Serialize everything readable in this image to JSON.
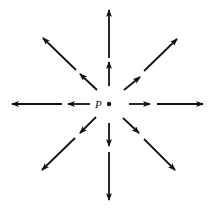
{
  "diagram": {
    "point_label": "P",
    "colors": {
      "stroke": "#111111",
      "background": "#ffffff"
    },
    "center": {
      "x": 109,
      "y": 104
    },
    "arrows": [
      {
        "direction": "up",
        "segments": [
          {
            "from": [
              109,
              86
            ],
            "to": [
              109,
              62
            ]
          },
          {
            "from": [
              109,
              58
            ],
            "to": [
              109,
              10
            ]
          }
        ]
      },
      {
        "direction": "down",
        "segments": [
          {
            "from": [
              109,
              123
            ],
            "to": [
              109,
              146
            ]
          },
          {
            "from": [
              109,
              152
            ],
            "to": [
              109,
              200
            ]
          }
        ]
      },
      {
        "direction": "left",
        "segments": [
          {
            "from": [
              90,
              104
            ],
            "to": [
              68,
              104
            ]
          },
          {
            "from": [
              62,
              104
            ],
            "to": [
              12,
              104
            ]
          }
        ]
      },
      {
        "direction": "right",
        "segments": [
          {
            "from": [
              129,
              104
            ],
            "to": [
              150,
              104
            ]
          },
          {
            "from": [
              157,
              104
            ],
            "to": [
              203,
              104
            ]
          }
        ]
      },
      {
        "direction": "up-left",
        "segments": [
          {
            "from": [
              97,
              90
            ],
            "to": [
              80,
              74
            ]
          },
          {
            "from": [
              76,
              70
            ],
            "to": [
              43,
              38
            ]
          }
        ]
      },
      {
        "direction": "up-right",
        "segments": [
          {
            "from": [
              124,
              90
            ],
            "to": [
              140,
              77
            ]
          },
          {
            "from": [
              144,
              71
            ],
            "to": [
              177,
              39
            ]
          }
        ]
      },
      {
        "direction": "down-left",
        "segments": [
          {
            "from": [
              96,
              117
            ],
            "to": [
              80,
              133
            ]
          },
          {
            "from": [
              75,
              138
            ],
            "to": [
              42,
              170
            ]
          }
        ]
      },
      {
        "direction": "down-right",
        "segments": [
          {
            "from": [
              123,
              118
            ],
            "to": [
              139,
              133
            ]
          },
          {
            "from": [
              144,
              139
            ],
            "to": [
              175,
              170
            ]
          }
        ]
      }
    ]
  }
}
